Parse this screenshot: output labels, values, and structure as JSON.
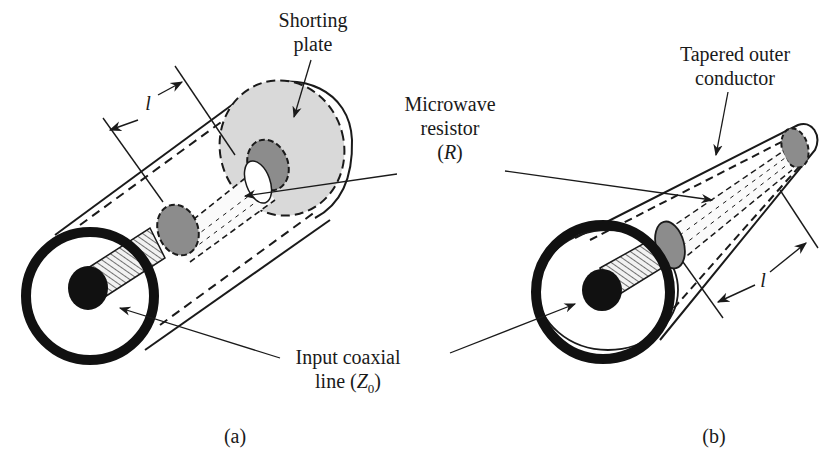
{
  "figure": {
    "panels": [
      {
        "id": "a",
        "caption": "(a)",
        "title": "Coaxial termination with shorting plate",
        "labels": {
          "shorting_plate_line1": "Shorting",
          "shorting_plate_line2": "plate",
          "length": "l"
        }
      },
      {
        "id": "b",
        "caption": "(b)",
        "title": "Coaxial termination with tapered outer conductor",
        "labels": {
          "tapered_line1": "Tapered outer",
          "tapered_line2": "conductor",
          "length": "l"
        }
      }
    ],
    "shared_labels": {
      "resistor_line1": "Microwave",
      "resistor_line2": "resistor",
      "resistor_symbol_open": "(",
      "resistor_symbol": "R",
      "resistor_symbol_close": ")",
      "input_line1": "Input coaxial",
      "input_line2_prefix": "line (",
      "input_symbol": "Z",
      "input_subscript": "0",
      "input_line2_suffix": ")"
    },
    "colors": {
      "ink": "#1a1a1a",
      "plate_fill": "#d9d9d9",
      "resistor_end_fill": "#8c8c8c",
      "background": "#ffffff"
    }
  }
}
